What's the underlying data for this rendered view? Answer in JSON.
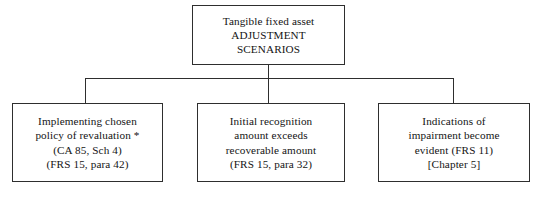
{
  "diagram": {
    "type": "tree",
    "title": "Tangible fixed asset ADJUSTMENT SCENARIOS",
    "root": {
      "id": "root",
      "lines": [
        "Tangible fixed asset",
        "ADJUSTMENT",
        "SCENARIOS"
      ]
    },
    "children": [
      {
        "id": "revaluation",
        "lines": [
          "Implementing chosen",
          "policy of revaluation *",
          "(CA 85, Sch 4)",
          "(FRS 15, para 42)"
        ]
      },
      {
        "id": "initial-recognition",
        "lines": [
          "Initial recognition",
          "amount exceeds",
          "recoverable amount",
          "(FRS 15, para 32)"
        ]
      },
      {
        "id": "impairment",
        "lines": [
          "Indications of",
          "impairment become",
          "evident (FRS 11)",
          "[Chapter 5]"
        ]
      }
    ],
    "colors": {
      "background": "#ffffff",
      "border": "#2e2e2e",
      "text": "#141414"
    }
  }
}
